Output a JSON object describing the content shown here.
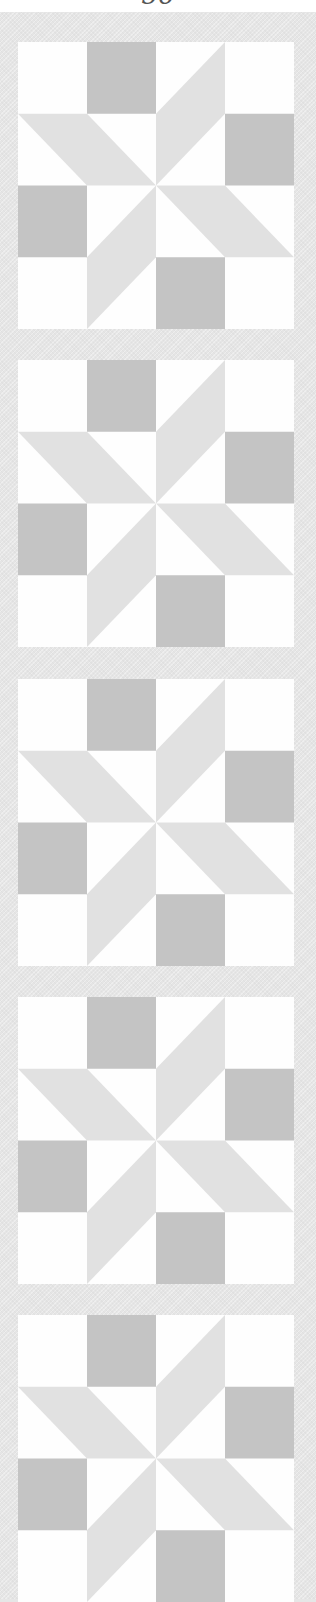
{
  "page": {
    "page_number": "56"
  },
  "colors": {
    "background": "#fefefe",
    "sashing": "#e5e5e5",
    "dark_square": "#c4c4c4",
    "star_piece": "#e1e1e1"
  },
  "quilt": {
    "pattern": "8-point pinwheel star block",
    "grid": 4,
    "blocks": [
      {
        "index": 1,
        "top": 42
      },
      {
        "index": 2,
        "top": 360
      },
      {
        "index": 3,
        "top": 679
      },
      {
        "index": 4,
        "top": 997
      },
      {
        "index": 5,
        "top": 1315
      }
    ],
    "dark_squares": [
      [
        1,
        0
      ],
      [
        3,
        1
      ],
      [
        0,
        2
      ],
      [
        2,
        3
      ]
    ],
    "star_arms": [
      [
        [
          0,
          1
        ],
        [
          1,
          1
        ],
        [
          2,
          2
        ],
        [
          1,
          2
        ]
      ],
      [
        [
          2,
          2
        ],
        [
          2,
          1
        ],
        [
          3,
          0
        ],
        [
          3,
          1
        ]
      ],
      [
        [
          2,
          2
        ],
        [
          3,
          2
        ],
        [
          4,
          3
        ],
        [
          3,
          3
        ]
      ],
      [
        [
          2,
          2
        ],
        [
          2,
          3
        ],
        [
          1,
          4
        ],
        [
          1,
          3
        ]
      ]
    ]
  }
}
